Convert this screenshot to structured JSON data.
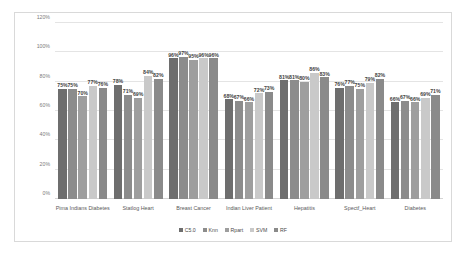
{
  "chart_data": {
    "type": "bar",
    "title": "",
    "xlabel": "",
    "ylabel": "",
    "ylim": [
      0,
      120
    ],
    "ytick_labels": [
      "0%",
      "20%",
      "40%",
      "60%",
      "80%",
      "100%",
      "120%"
    ],
    "ytick_values": [
      0,
      20,
      40,
      60,
      80,
      100,
      120
    ],
    "grid": true,
    "legend_position": "bottom",
    "value_suffix": "%",
    "categories": [
      "Pima Indians Diabetes",
      "Statlog Heart",
      "Breast Cancer",
      "Indian Liver Patient",
      "Hepatitis",
      "Spectf_Heart",
      "Diabetes"
    ],
    "series": [
      {
        "name": "C5.0",
        "color": "#6e6e6e",
        "values": [
          75,
          78,
          96,
          68,
          81,
          76,
          66
        ],
        "labels": [
          "75%",
          "78%",
          "96%",
          "68%",
          "81%",
          "76%",
          "66%"
        ]
      },
      {
        "name": "Knn",
        "color": "#8c8c8c",
        "values": [
          75,
          71,
          97,
          67,
          81,
          77,
          67
        ],
        "labels": [
          "75%",
          "71%",
          "97%",
          "67%",
          "81%",
          "77%",
          "67%"
        ]
      },
      {
        "name": "Rpart",
        "color": "#9e9e9e",
        "values": [
          70,
          69,
          95,
          66,
          80,
          75,
          66
        ],
        "labels": [
          "70%",
          "69%",
          "95%",
          "66%",
          "80%",
          "75%",
          "66%"
        ]
      },
      {
        "name": "SVM",
        "color": "#c9c9c9",
        "values": [
          77,
          84,
          96,
          72,
          86,
          79,
          69
        ],
        "labels": [
          "77%",
          "84%",
          "96%",
          "72%",
          "86%",
          "79%",
          "69%"
        ]
      },
      {
        "name": "RF",
        "color": "#8a8a8a",
        "values": [
          76,
          82,
          96,
          73,
          83,
          82,
          71
        ],
        "labels": [
          "76%",
          "82%",
          "96%",
          "73%",
          "83%",
          "82%",
          "71%"
        ]
      }
    ]
  }
}
